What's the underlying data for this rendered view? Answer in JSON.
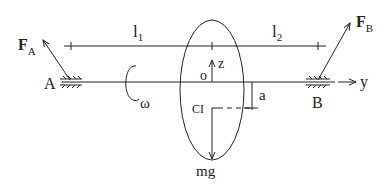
{
  "diagram": {
    "type": "rotor-on-shaft free body diagram",
    "labels": {
      "force_a": "F",
      "force_a_sub": "A",
      "force_b": "F",
      "force_b_sub": "B",
      "bearing_a": "A",
      "bearing_b": "B",
      "length_1": "l",
      "length_1_sub": "1",
      "length_2": "l",
      "length_2_sub": "2",
      "origin": "o",
      "z_axis": "z",
      "y_axis": "y",
      "center_of_mass": "CI",
      "offset": "a",
      "angular_velocity": "ω",
      "weight": "mg"
    },
    "colors": {
      "line": "#222222",
      "background": "#ffffff"
    }
  }
}
